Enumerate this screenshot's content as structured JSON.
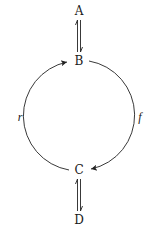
{
  "nodes": {
    "a": {
      "label": "A",
      "x": 79,
      "y": 11
    },
    "b": {
      "label": "B",
      "x": 79,
      "y": 61
    },
    "c": {
      "label": "C",
      "x": 79,
      "y": 170
    },
    "d": {
      "label": "D",
      "x": 79,
      "y": 220
    }
  },
  "edges": {
    "ab": {
      "from": "A",
      "to": "B",
      "type": "harpoon-pair"
    },
    "cd": {
      "from": "C",
      "to": "D",
      "type": "harpoon-pair"
    },
    "f": {
      "label": "f",
      "from": "B",
      "to": "C",
      "side": "right"
    },
    "r": {
      "label": "r",
      "from": "C",
      "to": "B",
      "side": "left"
    }
  },
  "colors": {
    "stroke": "#222222",
    "text": "#1a1a1a",
    "background": "#ffffff"
  }
}
